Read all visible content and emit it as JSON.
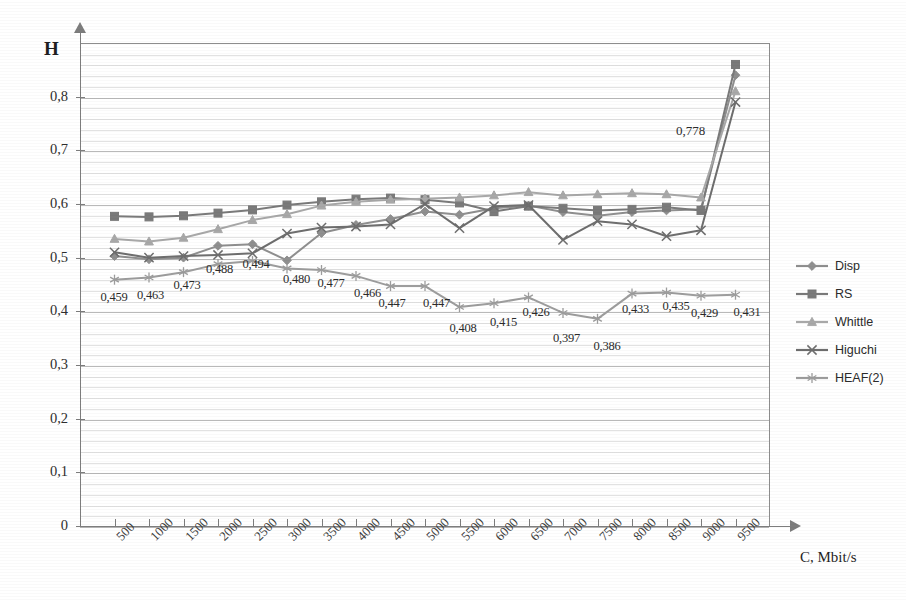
{
  "chart_data": {
    "type": "line",
    "title": "",
    "xlabel": "C, Mbit/s",
    "ylabel": "H",
    "xlim": [
      0,
      10000
    ],
    "ylim": [
      0,
      0.9
    ],
    "grid": true,
    "legend_position": "right",
    "x": [
      500,
      1000,
      1500,
      2000,
      2500,
      3000,
      3500,
      4000,
      4500,
      5000,
      5500,
      6000,
      6500,
      7000,
      7500,
      8000,
      8500,
      9000,
      9500
    ],
    "y_ticks": [
      "0",
      "0,1",
      "0,2",
      "0,3",
      "0,4",
      "0,5",
      "0,6",
      "0,7",
      "0,8"
    ],
    "y_tick_values": [
      0,
      0.1,
      0.2,
      0.3,
      0.4,
      0.5,
      0.6,
      0.7,
      0.8
    ],
    "x_tick_labels": [
      "500",
      "1000",
      "1500",
      "2000",
      "2500",
      "3000",
      "3500",
      "4000",
      "4500",
      "5000",
      "5500",
      "6000",
      "6500",
      "7000",
      "7500",
      "8000",
      "8500",
      "9000",
      "9500"
    ],
    "series": [
      {
        "name": "Disp",
        "marker": "diamond",
        "color": "#8f8f8f",
        "values": [
          0.503,
          0.497,
          0.5,
          0.522,
          0.525,
          0.495,
          0.546,
          0.561,
          0.572,
          0.586,
          0.58,
          0.592,
          0.597,
          0.585,
          0.578,
          0.585,
          0.588,
          0.59,
          0.84
        ]
      },
      {
        "name": "RS",
        "marker": "square",
        "color": "#7a7a7a",
        "values": [
          0.577,
          0.576,
          0.578,
          0.583,
          0.589,
          0.598,
          0.604,
          0.609,
          0.611,
          0.608,
          0.602,
          0.586,
          0.596,
          0.592,
          0.588,
          0.59,
          0.594,
          0.588,
          0.86
        ]
      },
      {
        "name": "Whittle",
        "marker": "triangle",
        "color": "#a8a8a8",
        "values": [
          0.535,
          0.53,
          0.537,
          0.553,
          0.57,
          0.581,
          0.597,
          0.604,
          0.608,
          0.61,
          0.612,
          0.616,
          0.622,
          0.616,
          0.618,
          0.62,
          0.618,
          0.612,
          0.81
        ]
      },
      {
        "name": "Higuchi",
        "marker": "x",
        "color": "#6e6e6e",
        "values": [
          0.51,
          0.5,
          0.503,
          0.505,
          0.508,
          0.545,
          0.556,
          0.558,
          0.562,
          0.6,
          0.555,
          0.596,
          0.598,
          0.533,
          0.568,
          0.562,
          0.54,
          0.551,
          0.79
        ]
      },
      {
        "name": "HEAF(2)",
        "marker": "asterisk",
        "color": "#9d9d9d",
        "values": [
          0.459,
          0.463,
          0.473,
          0.488,
          0.494,
          0.48,
          0.477,
          0.466,
          0.447,
          0.447,
          0.408,
          0.415,
          0.426,
          0.397,
          0.386,
          0.433,
          0.435,
          0.429,
          0.431
        ]
      }
    ],
    "data_labels": [
      {
        "text": "0,459",
        "x_index": 0,
        "value": 0.459
      },
      {
        "text": "0,463",
        "x_index": 1,
        "value": 0.463
      },
      {
        "text": "0,473",
        "x_index": 2,
        "value": 0.473
      },
      {
        "text": "0,488",
        "x_index": 3,
        "value": 0.488
      },
      {
        "text": "0,494",
        "x_index": 4,
        "value": 0.494
      },
      {
        "text": "0,480",
        "x_index": 5,
        "value": 0.48
      },
      {
        "text": "0,477",
        "x_index": 6,
        "value": 0.477
      },
      {
        "text": "0,466",
        "x_index": 7,
        "value": 0.466
      },
      {
        "text": "0,447",
        "x_index": 8,
        "value": 0.447
      },
      {
        "text": "0,447",
        "x_index": 9,
        "value": 0.447
      },
      {
        "text": "0,408",
        "x_index": 10,
        "value": 0.408
      },
      {
        "text": "0,415",
        "x_index": 11,
        "value": 0.415
      },
      {
        "text": "0,426",
        "x_index": 12,
        "value": 0.426
      },
      {
        "text": "0,397",
        "x_index": 13,
        "value": 0.397
      },
      {
        "text": "0,386",
        "x_index": 14,
        "value": 0.386
      },
      {
        "text": "0,433",
        "x_index": 15,
        "value": 0.433
      },
      {
        "text": "0,435",
        "x_index": 16,
        "value": 0.435
      },
      {
        "text": "0,429",
        "x_index": 17,
        "value": 0.429
      },
      {
        "text": "0,431",
        "x_index": 18,
        "value": 0.431
      },
      {
        "text": "0,778",
        "x_index": 18,
        "value": 0.778
      }
    ]
  },
  "legend": {
    "items": [
      {
        "label": "Disp"
      },
      {
        "label": "RS"
      },
      {
        "label": "Whittle"
      },
      {
        "label": "Higuchi"
      },
      {
        "label": "HEAF(2)"
      }
    ]
  },
  "axes": {
    "y_title": "H",
    "x_title": "C, Mbit/s"
  }
}
